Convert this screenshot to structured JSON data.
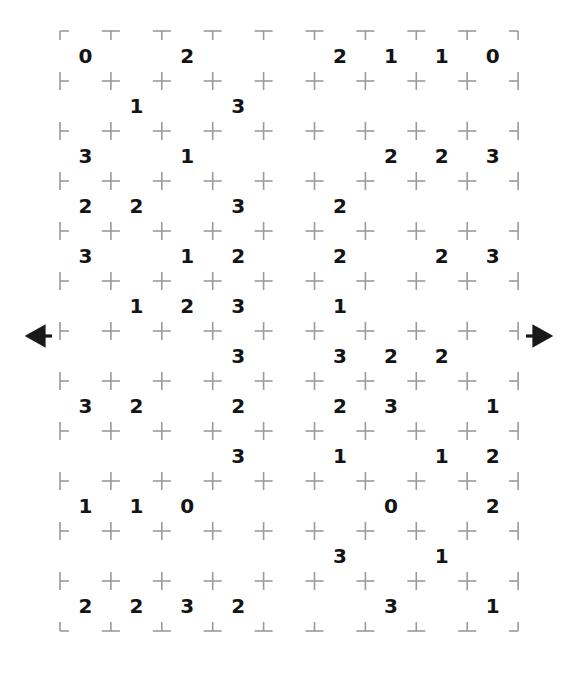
{
  "puzzle": {
    "title": "Slitherlink style number grid",
    "grid": {
      "cell_columns": 9,
      "cell_rows": 12,
      "lattice_columns": 10,
      "lattice_rows": 13,
      "origin_x": 60,
      "origin_y": 31,
      "spacing_x": 50.9,
      "spacing_y": 50.0,
      "dot_color": "#9a9a9a",
      "clue_color": "#141414",
      "background_color": "#ffffff"
    },
    "clues": [
      [
        "0",
        "",
        "2",
        "",
        "",
        "2",
        "1",
        "1",
        "0"
      ],
      [
        "",
        "1",
        "",
        "3",
        "",
        "",
        "",
        "",
        ""
      ],
      [
        "3",
        "",
        "1",
        "",
        "",
        "",
        "2",
        "2",
        "3"
      ],
      [
        "2",
        "2",
        "",
        "3",
        "",
        "2",
        "",
        "",
        ""
      ],
      [
        "3",
        "",
        "1",
        "2",
        "",
        "2",
        "",
        "2",
        "3"
      ],
      [
        "",
        "1",
        "2",
        "3",
        "",
        "1",
        "",
        "",
        ""
      ],
      [
        "",
        "",
        "",
        "3",
        "",
        "3",
        "2",
        "2",
        ""
      ],
      [
        "3",
        "2",
        "",
        "2",
        "",
        "2",
        "3",
        "",
        "1"
      ],
      [
        "",
        "",
        "",
        "3",
        "",
        "1",
        "",
        "1",
        "2"
      ],
      [
        "1",
        "1",
        "0",
        "",
        "",
        "",
        "0",
        "",
        "2"
      ],
      [
        "",
        "",
        "",
        "",
        "",
        "3",
        "",
        "1",
        ""
      ],
      [
        "2",
        "2",
        "3",
        "2",
        "",
        "",
        "3",
        "",
        "1"
      ]
    ],
    "arrows": {
      "left": {
        "glyph": "left-arrow",
        "row_index": 6,
        "x": 30,
        "y": 336,
        "color": "#1a1a1a"
      },
      "right": {
        "glyph": "right-arrow",
        "row_index": 6,
        "x": 548,
        "y": 336,
        "color": "#1a1a1a"
      }
    }
  }
}
